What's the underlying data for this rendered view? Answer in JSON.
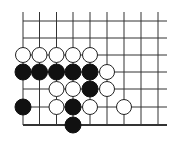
{
  "diagram": {
    "type": "go-board-fragment",
    "colors": {
      "background": "#ffffff",
      "line": "#333333",
      "black_stone": "#111111",
      "white_stone": "#ffffff",
      "white_stroke": "#222222"
    },
    "grid": {
      "cols": 9,
      "rows": 7,
      "x": [
        23,
        39.5,
        56.5,
        73,
        90,
        107,
        124,
        141,
        158
      ],
      "y": [
        21,
        38,
        55,
        72,
        89,
        107,
        125
      ],
      "top_extend": 12,
      "right_extend": 167,
      "bottom_edge_thick": true
    },
    "stones": [
      {
        "col": 0,
        "row": 2,
        "color": "white"
      },
      {
        "col": 1,
        "row": 2,
        "color": "white"
      },
      {
        "col": 2,
        "row": 2,
        "color": "white"
      },
      {
        "col": 3,
        "row": 2,
        "color": "white"
      },
      {
        "col": 4,
        "row": 2,
        "color": "white"
      },
      {
        "col": 0,
        "row": 3,
        "color": "black"
      },
      {
        "col": 1,
        "row": 3,
        "color": "black"
      },
      {
        "col": 2,
        "row": 3,
        "color": "black"
      },
      {
        "col": 3,
        "row": 3,
        "color": "black"
      },
      {
        "col": 4,
        "row": 3,
        "color": "black"
      },
      {
        "col": 5,
        "row": 3,
        "color": "white"
      },
      {
        "col": 2,
        "row": 4,
        "color": "white"
      },
      {
        "col": 3,
        "row": 4,
        "color": "white"
      },
      {
        "col": 4,
        "row": 4,
        "color": "black"
      },
      {
        "col": 5,
        "row": 4,
        "color": "white"
      },
      {
        "col": 0,
        "row": 5,
        "color": "black"
      },
      {
        "col": 2,
        "row": 5,
        "color": "white"
      },
      {
        "col": 3,
        "row": 5,
        "color": "black"
      },
      {
        "col": 4,
        "row": 5,
        "color": "white"
      },
      {
        "col": 6,
        "row": 5,
        "color": "white"
      },
      {
        "col": 3,
        "row": 6,
        "color": "black"
      }
    ]
  }
}
